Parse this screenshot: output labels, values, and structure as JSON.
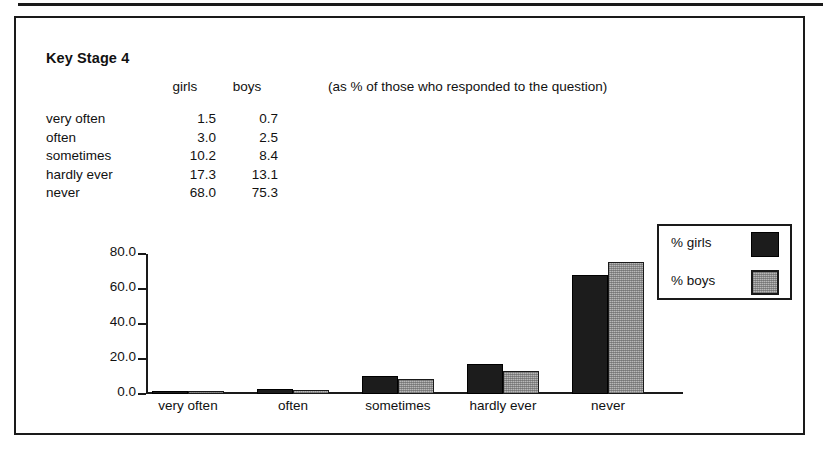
{
  "top_rule": {
    "present": true
  },
  "figure": {
    "title": "Key Stage 4",
    "note": "(as % of those who responded to the question)",
    "table": {
      "columns": [
        "",
        "girls",
        "boys"
      ],
      "rows": [
        {
          "label": "very often",
          "girls": "1.5",
          "boys": "0.7"
        },
        {
          "label": "often",
          "girls": "3.0",
          "boys": "2.5"
        },
        {
          "label": "sometimes",
          "girls": "10.2",
          "boys": "8.4"
        },
        {
          "label": "hardly ever",
          "girls": "17.3",
          "boys": "13.1"
        },
        {
          "label": "never",
          "girls": "68.0",
          "boys": "75.3"
        }
      ]
    },
    "legend": {
      "entries": [
        {
          "label": "% girls",
          "swatch": "dark-solid-swatch",
          "color": "#1c1c1c"
        },
        {
          "label": "% boys",
          "swatch": "light-hatched-swatch",
          "color": "#b8b8b8"
        }
      ]
    },
    "axis": {
      "y_ticks": [
        "80.0_",
        "60.0_",
        "40.0_",
        "20.0_",
        "0.0_"
      ],
      "y_tick_values": [
        "80.0",
        "60.0",
        "40.0",
        "20.0",
        "0.0"
      ]
    }
  },
  "chart_data": {
    "type": "bar",
    "title": "Key Stage 4",
    "subtitle": "(as % of those who responded to the question)",
    "categories": [
      "very often",
      "often",
      "sometimes",
      "hardly ever",
      "never"
    ],
    "series": [
      {
        "name": "% girls",
        "values": [
          1.5,
          3.0,
          10.2,
          17.3,
          68.0
        ],
        "color": "#1c1c1c"
      },
      {
        "name": "% boys",
        "values": [
          0.7,
          2.5,
          8.4,
          13.1,
          75.3
        ],
        "color": "#b8b8b8"
      }
    ],
    "xlabel": "",
    "ylabel": "",
    "ylim": [
      0.0,
      80.0
    ],
    "ytick_step": 20.0,
    "grid": false,
    "legend_position": "right-inside-top"
  }
}
